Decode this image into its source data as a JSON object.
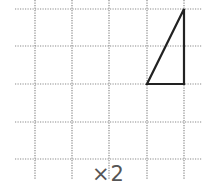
{
  "diagram": {
    "type": "grid-with-triangle",
    "grid": {
      "vertical_lines_x": [
        35,
        72,
        109,
        147,
        184
      ],
      "horizontal_lines_y": [
        9,
        46,
        84,
        122,
        159
      ],
      "line_color": "#888888",
      "style": "dotted"
    },
    "triangle": {
      "points": [
        [
          147,
          84
        ],
        [
          184,
          84
        ],
        [
          184,
          9
        ]
      ],
      "stroke": "#222222"
    },
    "label": "×2"
  }
}
